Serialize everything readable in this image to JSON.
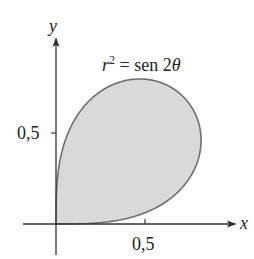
{
  "figure": {
    "equation_label": {
      "r": "r",
      "sup": "2",
      "rest": " = sen 2",
      "theta": "θ"
    },
    "axes": {
      "x_label": "x",
      "y_label": "y",
      "x_tick_label": "0,5",
      "y_tick_label": "0,5"
    },
    "colors": {
      "fill": "#d9d9d9",
      "curve": "#6e6e6e",
      "axis": "#333333"
    }
  },
  "chart_data": {
    "type": "polar-curve",
    "equation": "r^2 = sin(2θ)",
    "theta_range": [
      0,
      1.5708
    ],
    "region": "shaded loop in first quadrant",
    "xlabel": "x",
    "ylabel": "y",
    "x_ticks": [
      0.5
    ],
    "y_ticks": [
      0.5
    ],
    "tick_labels": [
      "0,5"
    ],
    "xlim": [
      -0.05,
      1.0
    ],
    "ylim": [
      -0.2,
      1.0
    ],
    "grid": false
  }
}
